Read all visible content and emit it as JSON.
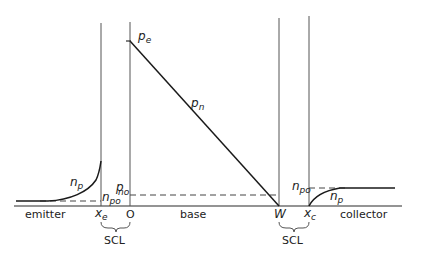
{
  "diagram": {
    "regions": {
      "emitter": "emitter",
      "base": "base",
      "collector": "collector"
    },
    "axis_labels": {
      "xe_main": "x",
      "xe_sub": "e",
      "origin": "O",
      "w": "W",
      "xc_main": "x",
      "xc_sub": "c"
    },
    "scl_labels": {
      "left": "SCL",
      "right": "SCL"
    },
    "curve_labels": {
      "pe_main": "p",
      "pe_sub": "e",
      "pn_main": "p",
      "pn_sub": "n",
      "np_emitter_main": "n",
      "np_emitter_sub": "p",
      "npo_emitter_main": "n",
      "npo_emitter_sub": "po",
      "pno_main": "p",
      "pno_sub": "no",
      "npo_collector_main": "n",
      "npo_collector_sub": "po",
      "np_collector_main": "n",
      "np_collector_sub": "p"
    }
  }
}
